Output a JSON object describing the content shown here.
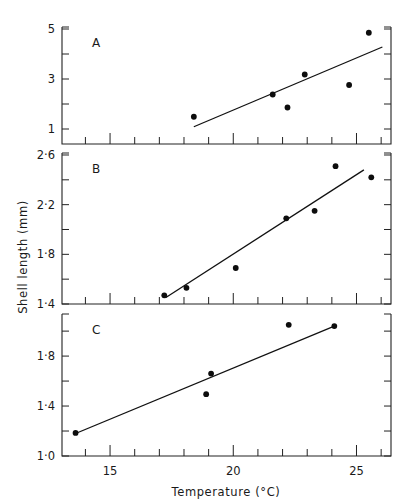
{
  "chart_data": [
    {
      "panel": "A",
      "type": "scatter",
      "title": "",
      "panel_label": "A",
      "xlabel": "Temperature (°C)",
      "ylabel": "Shell length (mm)",
      "xlim": [
        13.05,
        26.4
      ],
      "ylim": [
        0.4,
        5.08
      ],
      "yticks_labeled": [
        1,
        3,
        5
      ],
      "yticks_minor": [
        2,
        4
      ],
      "x": [
        18.4,
        21.6,
        22.2,
        22.9,
        24.7,
        25.5
      ],
      "y": [
        1.49,
        2.38,
        1.86,
        3.18,
        2.76,
        4.85
      ],
      "fit_line": {
        "x": [
          18.4,
          26.05
        ],
        "y": [
          1.09,
          4.28
        ]
      },
      "grid": false
    },
    {
      "panel": "B",
      "type": "scatter",
      "title": "",
      "panel_label": "B",
      "xlabel": "Temperature (°C)",
      "ylabel": "Shell length (mm)",
      "xlim": [
        13.05,
        26.4
      ],
      "ylim": [
        1.4,
        2.616
      ],
      "yticks_labeled": [
        1.4,
        1.8,
        2.2,
        2.6
      ],
      "yticks_minor": [
        1.6,
        2.0,
        2.4
      ],
      "x": [
        17.2,
        18.1,
        20.1,
        22.15,
        23.3,
        24.15,
        25.6
      ],
      "y": [
        1.47,
        1.53,
        1.69,
        2.09,
        2.15,
        2.51,
        2.42
      ],
      "fit_line": {
        "x": [
          17.25,
          25.3
        ],
        "y": [
          1.45,
          2.48
        ]
      },
      "grid": false
    },
    {
      "panel": "C",
      "type": "scatter",
      "title": "",
      "panel_label": "C",
      "xlabel": "Temperature (°C)",
      "ylabel": "Shell length (mm)",
      "xlim": [
        13.05,
        26.4
      ],
      "ylim": [
        1.0,
        2.137
      ],
      "yticks_labeled": [
        1.0,
        1.4,
        1.8
      ],
      "yticks_minor": [
        1.2,
        1.6,
        2.0
      ],
      "x": [
        13.6,
        18.9,
        19.1,
        22.25,
        24.1
      ],
      "y": [
        1.185,
        1.495,
        1.66,
        2.05,
        2.04
      ],
      "fit_line": {
        "x": [
          13.6,
          24.1
        ],
        "y": [
          1.18,
          2.04
        ]
      },
      "grid": false
    }
  ],
  "figure": {
    "xlabel": "Temperature (°C)",
    "ylabel": "Shell length (mm)",
    "xticks_labeled": [
      15,
      20,
      25
    ],
    "xtick_labels": [
      "15",
      "20",
      "25"
    ],
    "xticks_minor": [
      14,
      16,
      17,
      18,
      19,
      21,
      22,
      23,
      24,
      26
    ],
    "panels": [
      {
        "label": "A",
        "ytick_labels": [
          "1",
          "3",
          "5"
        ]
      },
      {
        "label": "B",
        "ytick_labels": [
          "1·4",
          "1·8",
          "2·2",
          "2·6"
        ]
      },
      {
        "label": "C",
        "ytick_labels": [
          "1·0",
          "1·4",
          "1·8"
        ]
      }
    ]
  },
  "colors": {
    "ink": "#111111",
    "background": "#ffffff"
  }
}
